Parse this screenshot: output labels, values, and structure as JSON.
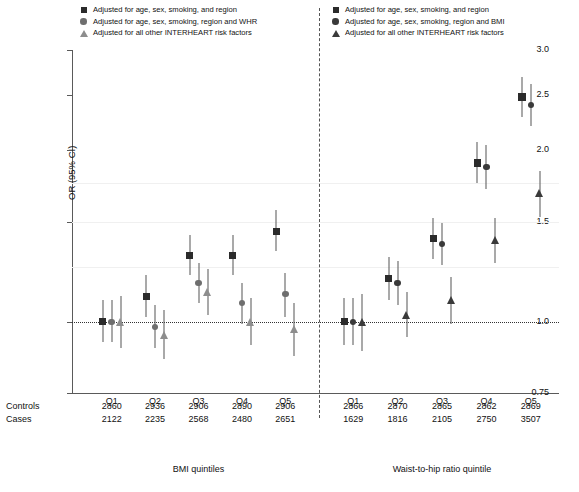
{
  "legend_left": {
    "items": [
      {
        "marker": "square",
        "label": "Adjusted for age, sex, smoking, and region"
      },
      {
        "marker": "circle",
        "label": "Adjusted for age, sex, smoking, region and WHR"
      },
      {
        "marker": "triangle",
        "label": "Adjusted for all other INTERHEART risk factors"
      }
    ]
  },
  "legend_right": {
    "items": [
      {
        "marker": "square",
        "label": "Adjusted for age, sex, smoking, and region"
      },
      {
        "marker": "circle",
        "label": "Adjusted for age, sex, smoking, region and BMI"
      },
      {
        "marker": "triangle",
        "label": "Adjusted for all other INTERHEART risk factors"
      }
    ]
  },
  "axis": {
    "ylabel": "OR (95% CI)",
    "yticks": [
      "3.0",
      "2.5",
      "2.0",
      "1.5",
      "1.0",
      "0.75"
    ],
    "ytick_values": [
      3.0,
      2.5,
      2.0,
      1.5,
      1.0,
      0.75
    ],
    "ylim": [
      0.75,
      3.0
    ],
    "scale": "log",
    "reference_line": 1.0
  },
  "panels": [
    {
      "title": "BMI quintiles",
      "categories": [
        "Q1",
        "Q2",
        "Q3",
        "Q4",
        "Q5"
      ],
      "rows": [
        {
          "name": "Controls",
          "values": [
            "2860",
            "2936",
            "2906",
            "2890",
            "2906"
          ]
        },
        {
          "name": "Cases",
          "values": [
            "2122",
            "2235",
            "2568",
            "2480",
            "2651"
          ]
        }
      ]
    },
    {
      "title": "Waist-to-hip ratio quintile",
      "categories": [
        "Q1",
        "Q2",
        "Q3",
        "Q4",
        "Q5"
      ],
      "rows": [
        {
          "name": "Controls",
          "values": [
            "2866",
            "2870",
            "2865",
            "2862",
            "2869"
          ]
        },
        {
          "name": "Cases",
          "values": [
            "1629",
            "1816",
            "2105",
            "2750",
            "3507"
          ]
        }
      ]
    }
  ],
  "table_labels": {
    "controls": "Controls",
    "cases": "Cases"
  },
  "colors": {
    "square": "#2b2b2b",
    "circle_dark": "#3a3a3a",
    "circle_light": "#6e6e6e",
    "triangle_dark": "#3a3a3a",
    "triangle_light": "#8d8d8d",
    "whisker": "#555555",
    "axis": "#5a5a5a",
    "grid": "#f0f0f0",
    "divider": "#555555"
  },
  "chart_data": {
    "type": "scatter",
    "title": "",
    "subtitle": "",
    "xlabel": "",
    "ylabel": "OR (95% CI)",
    "ylim": [
      0.75,
      3.0
    ],
    "yscale": "log",
    "yticks": [
      3.0,
      2.5,
      2.0,
      1.5,
      1.0,
      0.75
    ],
    "grid": false,
    "reference_line": 1.0,
    "legend_position": "top",
    "panels": [
      {
        "name": "BMI quintiles",
        "categories": [
          "Q1",
          "Q2",
          "Q3",
          "Q4",
          "Q5"
        ],
        "series": [
          {
            "name": "Adjusted for age, sex, smoking, and region",
            "marker": "square",
            "color": "#2b2b2b",
            "values": [
              1.0,
              1.11,
              1.31,
              1.31,
              1.44
            ],
            "ci_low": [
              0.92,
              1.02,
              1.21,
              1.21,
              1.33
            ],
            "ci_high": [
              1.09,
              1.21,
              1.42,
              1.42,
              1.57
            ]
          },
          {
            "name": "Adjusted for age, sex, smoking, region and WHR",
            "marker": "circle",
            "color": "#6e6e6e",
            "values": [
              1.0,
              0.98,
              1.17,
              1.08,
              1.12
            ],
            "ci_low": [
              0.92,
              0.9,
              1.08,
              0.99,
              1.02
            ],
            "ci_high": [
              1.09,
              1.07,
              1.27,
              1.17,
              1.22
            ]
          },
          {
            "name": "Adjusted for all other INTERHEART risk factors",
            "marker": "triangle",
            "color": "#8d8d8d",
            "values": [
              1.0,
              0.95,
              1.13,
              1.0,
              0.97
            ],
            "ci_low": [
              0.9,
              0.86,
              1.03,
              0.91,
              0.87
            ],
            "ci_high": [
              1.11,
              1.05,
              1.24,
              1.1,
              1.08
            ]
          }
        ]
      },
      {
        "name": "Waist-to-hip ratio quintile",
        "categories": [
          "Q1",
          "Q2",
          "Q3",
          "Q4",
          "Q5"
        ],
        "series": [
          {
            "name": "Adjusted for age, sex, smoking, and region",
            "marker": "square",
            "color": "#2b2b2b",
            "values": [
              1.0,
              1.19,
              1.4,
              1.9,
              2.48
            ],
            "ci_low": [
              0.91,
              1.09,
              1.29,
              1.75,
              2.29
            ],
            "ci_high": [
              1.1,
              1.3,
              1.52,
              2.07,
              2.69
            ]
          },
          {
            "name": "Adjusted for age, sex, smoking, region and BMI",
            "marker": "circle",
            "color": "#3a3a3a",
            "values": [
              1.0,
              1.17,
              1.37,
              1.87,
              2.4
            ],
            "ci_low": [
              0.91,
              1.07,
              1.26,
              1.71,
              2.21
            ],
            "ci_high": [
              1.1,
              1.28,
              1.49,
              2.04,
              2.61
            ]
          },
          {
            "name": "Adjusted for all other INTERHEART risk factors",
            "marker": "triangle",
            "color": "#3a3a3a",
            "values": [
              1.0,
              1.03,
              1.09,
              1.39,
              1.68
            ],
            "ci_low": [
              0.89,
              0.94,
              0.99,
              1.27,
              1.53
            ],
            "ci_high": [
              1.12,
              1.13,
              1.2,
              1.52,
              1.84
            ]
          }
        ]
      }
    ]
  }
}
